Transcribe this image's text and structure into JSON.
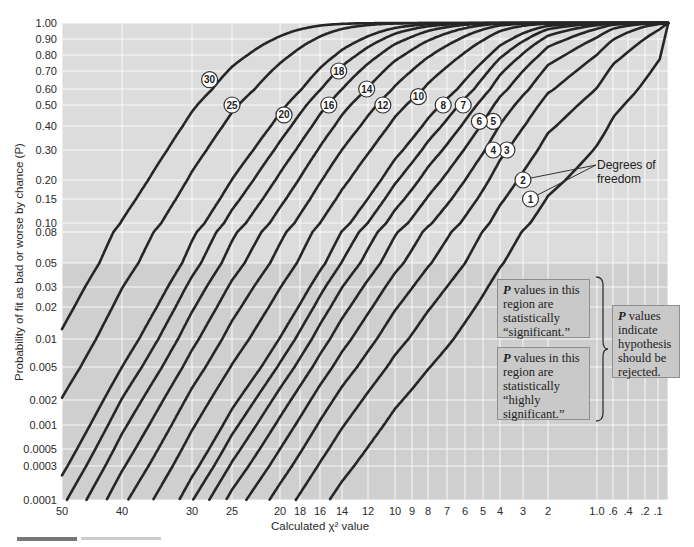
{
  "chart_data": {
    "type": "line",
    "title": "",
    "xlabel": "Calculated χ² value",
    "ylabel": "Probability of fit as bad or worse by chance (P)",
    "x_axis": {
      "reversed": true,
      "tick_labels": [
        "50",
        "40",
        "30",
        "25",
        "20",
        "18",
        "16",
        "14",
        "12",
        "10",
        "9",
        "8",
        "7",
        "6",
        "5",
        "4",
        "3",
        "2",
        "1.0",
        ".6",
        ".4",
        ".2",
        ".1"
      ],
      "tick_values": [
        50,
        40,
        30,
        25,
        20,
        18,
        16,
        14,
        12,
        10,
        9,
        8,
        7,
        6,
        5,
        4,
        3,
        2,
        1.0,
        0.6,
        0.4,
        0.2,
        0.1
      ],
      "range": [
        50,
        0
      ]
    },
    "y_axis": {
      "scale": "probability",
      "tick_labels": [
        "1.00",
        "0.90",
        "0.80",
        "0.70",
        "0.60",
        "0.50",
        "0.40",
        "0.30",
        "0.20",
        "0.15",
        "0.10",
        "0.08",
        "0.05",
        "0.03",
        "0.02",
        "0.01",
        "0.005",
        "0.002",
        "0.001",
        "0.0005",
        "0.0003",
        "0.0001"
      ],
      "tick_values": [
        1.0,
        0.9,
        0.8,
        0.7,
        0.6,
        0.5,
        0.4,
        0.3,
        0.2,
        0.15,
        0.1,
        0.08,
        0.05,
        0.03,
        0.02,
        0.01,
        0.005,
        0.002,
        0.001,
        0.0005,
        0.0003,
        0.0001
      ],
      "range": [
        0.0001,
        1.0
      ]
    },
    "grid": true,
    "series_description": "Each curve is P = P(χ² ≥ x) for the given degrees of freedom",
    "series": [
      {
        "name": "1",
        "df": 1,
        "label_at": {
          "x": 2.7,
          "p": 0.15
        }
      },
      {
        "name": "2",
        "df": 2,
        "label_at": {
          "x": 3.0,
          "p": 0.2
        }
      },
      {
        "name": "3",
        "df": 3,
        "label_at": {
          "x": 3.7,
          "p": 0.3
        }
      },
      {
        "name": "4",
        "df": 4,
        "label_at": {
          "x": 4.4,
          "p": 0.3
        }
      },
      {
        "name": "5",
        "df": 5,
        "label_at": {
          "x": 4.4,
          "p": 0.42
        }
      },
      {
        "name": "6",
        "df": 6,
        "label_at": {
          "x": 5.2,
          "p": 0.42
        }
      },
      {
        "name": "7",
        "df": 7,
        "label_at": {
          "x": 6.1,
          "p": 0.5
        }
      },
      {
        "name": "8",
        "df": 8,
        "label_at": {
          "x": 7.2,
          "p": 0.5
        }
      },
      {
        "name": "10",
        "df": 10,
        "label_at": {
          "x": 8.6,
          "p": 0.55
        }
      },
      {
        "name": "12",
        "df": 12,
        "label_at": {
          "x": 10.9,
          "p": 0.5
        }
      },
      {
        "name": "14",
        "df": 14,
        "label_at": {
          "x": 12.1,
          "p": 0.6
        }
      },
      {
        "name": "16",
        "df": 16,
        "label_at": {
          "x": 15.2,
          "p": 0.5
        }
      },
      {
        "name": "18",
        "df": 18,
        "label_at": {
          "x": 14.3,
          "p": 0.7
        }
      },
      {
        "name": "20",
        "df": 20,
        "label_at": {
          "x": 19.6,
          "p": 0.45
        }
      },
      {
        "name": "25",
        "df": 25,
        "label_at": {
          "x": 25.0,
          "p": 0.5
        }
      },
      {
        "name": "30",
        "df": 30,
        "label_at": {
          "x": 27.8,
          "p": 0.65
        }
      }
    ],
    "regions": [
      {
        "name": "significant",
        "p_range": [
          0.01,
          0.05
        ]
      },
      {
        "name": "highly significant",
        "p_range": [
          0.0001,
          0.01
        ]
      }
    ],
    "annotations": {
      "degrees_of_freedom": "Degrees of freedom",
      "significant": {
        "lead": "P",
        "text": " values in this region are statistically “significant.”"
      },
      "highly_significant": {
        "lead": "P",
        "text": " values in this region are statistically “highly significant.”"
      },
      "reject": {
        "lead": "P",
        "text": " values indicate hypothesis should be rejected."
      }
    }
  },
  "colors": {
    "plot_bg_upper": "#dcdcdc",
    "plot_bg_lower": "#cfcfcf",
    "curve": "#262626",
    "note_bg": "#c9c9c9"
  },
  "layout_px": {
    "x_ticks_px": [
      62,
      122,
      192,
      232,
      280,
      300,
      320,
      342,
      368,
      395,
      412,
      428,
      447,
      465,
      483,
      500,
      523,
      548,
      597,
      613,
      628,
      645,
      658
    ],
    "x_zero_px": 668,
    "y_ticks_px": [
      23,
      39,
      55,
      71,
      89,
      105,
      126,
      150,
      180,
      199,
      223,
      232,
      263,
      287,
      307,
      339,
      367,
      400,
      425,
      449,
      466,
      500
    ]
  }
}
